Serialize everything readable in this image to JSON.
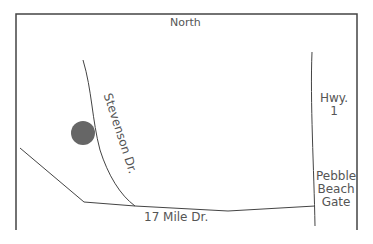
{
  "map": {
    "compass": "North",
    "roads": [
      {
        "name": "Stevenson Dr."
      },
      {
        "name": "17 Mile Dr."
      },
      {
        "name": "Hwy. 1",
        "lines": [
          "Hwy.",
          "1"
        ]
      }
    ],
    "landmarks": [
      {
        "name": "Pebble Beach Gate",
        "lines": [
          "Pebble",
          "Beach",
          "Gate"
        ]
      }
    ],
    "marker": {
      "color": "#666666"
    }
  }
}
